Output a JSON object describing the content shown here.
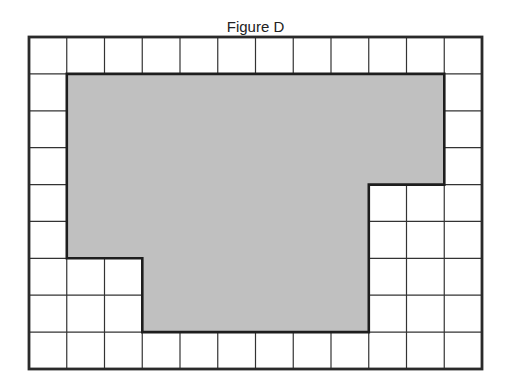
{
  "title": "Figure D",
  "grid": {
    "cols": 12,
    "rows": 9,
    "left": 29,
    "top": 37,
    "width": 453,
    "height": 332,
    "line_color": "#333333",
    "border_color": "#2a2a2a"
  },
  "shape": {
    "fill": "#c0c0c0",
    "stroke": "#1e1e1e",
    "vertices_grid_units": [
      [
        1,
        1
      ],
      [
        11,
        1
      ],
      [
        11,
        4
      ],
      [
        9,
        4
      ],
      [
        9,
        8
      ],
      [
        3,
        8
      ],
      [
        3,
        6
      ],
      [
        1,
        6
      ]
    ],
    "shaded_cell_count": 50
  }
}
